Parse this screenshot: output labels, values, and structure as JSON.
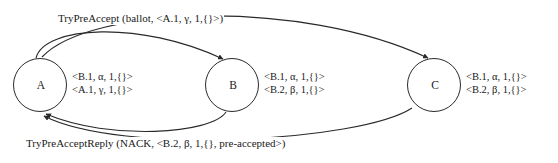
{
  "diagram": {
    "type": "state-transition-diagram",
    "width": 558,
    "height": 163,
    "background_color": "#ffffff",
    "stroke_color": "#2a2a2a",
    "text_color": "#1a1a1a",
    "nodes": [
      {
        "id": "A",
        "label": "A",
        "cx": 40,
        "cy": 85,
        "r": 27,
        "states": [
          "<B.1, α, 1,{}>",
          "<A.1, γ, 1,{}>"
        ]
      },
      {
        "id": "B",
        "label": "B",
        "cx": 232,
        "cy": 85,
        "r": 27,
        "states": [
          "<B.1, α, 1,{}>",
          "<B.2, β, 1,{}>"
        ]
      },
      {
        "id": "C",
        "label": "C",
        "cx": 434,
        "cy": 85,
        "r": 27,
        "states": [
          "<B.1, α, 1,{}>",
          "<B.2, β, 1,{}>"
        ]
      }
    ],
    "edges": [
      {
        "id": "a-to-b",
        "from": "A",
        "to": "B",
        "label_id": "try-pre-accept",
        "direction": "top"
      },
      {
        "id": "a-to-c",
        "from": "A",
        "to": "C",
        "label_id": "try-pre-accept",
        "direction": "top"
      },
      {
        "id": "b-to-a",
        "from": "B",
        "to": "A",
        "label_id": "try-pre-accept-reply",
        "direction": "bottom"
      },
      {
        "id": "c-to-a",
        "from": "C",
        "to": "A",
        "label_id": "try-pre-accept-reply",
        "direction": "bottom"
      }
    ],
    "labels": {
      "try_pre_accept": "TryPreAccept (ballot, <A.1, γ, 1,{}>)",
      "try_pre_accept_reply": "TryPreAcceptReply (NACK, <B.2, β, 1,{}, pre-accepted>)"
    }
  }
}
